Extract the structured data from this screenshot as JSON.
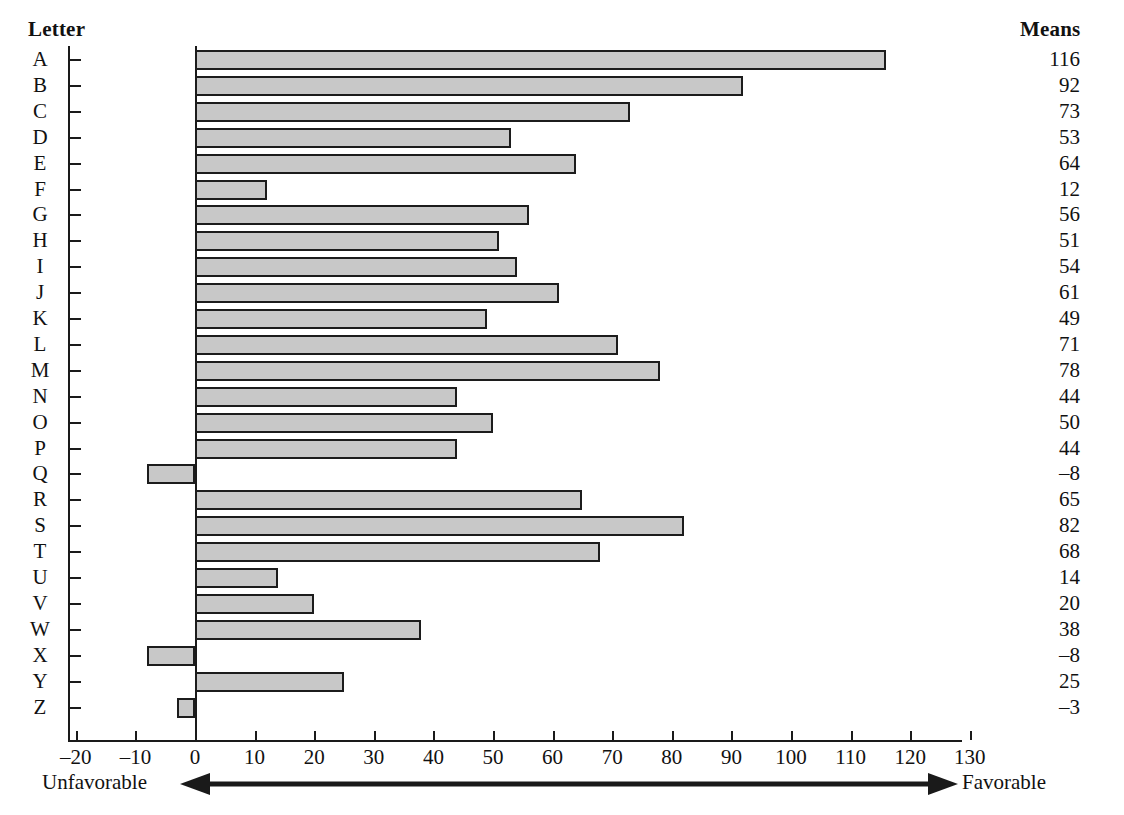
{
  "headers": {
    "category_column": "Letter",
    "means_column": "Means"
  },
  "annotations": {
    "left_label": "Unfavorable",
    "right_label": "Favorable"
  },
  "chart_data": {
    "type": "bar",
    "orientation": "horizontal",
    "title": "",
    "xlabel": "",
    "ylabel": "Letter",
    "xlim": [
      -20,
      130
    ],
    "ylim": null,
    "grid": false,
    "legend": null,
    "xticks": [
      -20,
      -10,
      0,
      10,
      20,
      30,
      40,
      50,
      60,
      70,
      80,
      90,
      100,
      110,
      120,
      130
    ],
    "xticklabels": [
      "–20",
      "–10",
      "0",
      "10",
      "20",
      "30",
      "40",
      "50",
      "60",
      "70",
      "80",
      "90",
      "100",
      "110",
      "120",
      "130"
    ],
    "categories": [
      "A",
      "B",
      "C",
      "D",
      "E",
      "F",
      "G",
      "H",
      "I",
      "J",
      "K",
      "L",
      "M",
      "N",
      "O",
      "P",
      "Q",
      "R",
      "S",
      "T",
      "U",
      "V",
      "W",
      "X",
      "Y",
      "Z"
    ],
    "values": [
      116,
      92,
      73,
      53,
      64,
      12,
      56,
      51,
      54,
      61,
      49,
      71,
      78,
      44,
      50,
      44,
      -8,
      65,
      82,
      68,
      14,
      20,
      38,
      -8,
      25,
      -3
    ],
    "value_labels": [
      "116",
      "92",
      "73",
      "53",
      "64",
      "12",
      "56",
      "51",
      "54",
      "61",
      "49",
      "71",
      "78",
      "44",
      "50",
      "44",
      "–8",
      "65",
      "82",
      "68",
      "14",
      "20",
      "38",
      "–8",
      "25",
      "–3"
    ],
    "colors": {
      "bar_fill": "#c8c8c8",
      "bar_border": "#1c1c1c",
      "axis": "#1a1a1a",
      "text": "#111111",
      "background": "#ffffff"
    }
  }
}
